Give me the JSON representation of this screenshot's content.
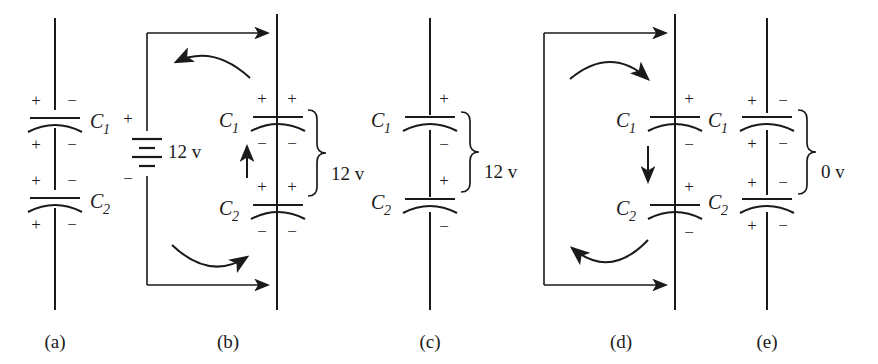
{
  "figure": {
    "background_color": "#ffffff",
    "line_color": "#1a1a1a",
    "panel_labels": [
      "(a)",
      "(b)",
      "(c)",
      "(d)",
      "(e)"
    ],
    "capacitor_names": {
      "c1": "C",
      "c1_sub": "1",
      "c2": "C",
      "c2_sub": "2"
    },
    "signs": {
      "plus": "+",
      "minus": "−"
    },
    "panels": [
      {
        "id": "a",
        "label": "(a)",
        "has_source": false,
        "has_loop": false,
        "has_brace": false,
        "brace_value": "",
        "cap_label_side": "right",
        "capacitors": [
          {
            "name_base": "C",
            "name_sub": "1",
            "top_left_sign": "+",
            "top_right_sign": "−",
            "bottom_left_sign": "+",
            "bottom_right_sign": "−"
          },
          {
            "name_base": "C",
            "name_sub": "2",
            "top_left_sign": "+",
            "top_right_sign": "−",
            "bottom_left_sign": "+",
            "bottom_right_sign": "−"
          }
        ]
      },
      {
        "id": "b",
        "label": "(b)",
        "has_source": true,
        "source_value": "12 v",
        "source_plus": "+",
        "source_minus": "−",
        "has_loop": true,
        "loop_arrow_direction": "clockwise",
        "inner_arrow_direction": "up",
        "has_brace": true,
        "brace_value": "12 v",
        "cap_label_side": "left",
        "capacitors": [
          {
            "name_base": "C",
            "name_sub": "1",
            "top_left_sign": "+",
            "top_right_sign": "+",
            "bottom_left_sign": "−",
            "bottom_right_sign": "−"
          },
          {
            "name_base": "C",
            "name_sub": "2",
            "top_left_sign": "+",
            "top_right_sign": "+",
            "bottom_left_sign": "−",
            "bottom_right_sign": "−"
          }
        ]
      },
      {
        "id": "c",
        "label": "(c)",
        "has_source": false,
        "has_loop": false,
        "has_brace": true,
        "brace_value": "12 v",
        "cap_label_side": "left",
        "capacitors": [
          {
            "name_base": "C",
            "name_sub": "1",
            "top_right_sign": "+",
            "bottom_right_sign": "−"
          },
          {
            "name_base": "C",
            "name_sub": "2",
            "top_right_sign": "+",
            "bottom_right_sign": "−"
          }
        ]
      },
      {
        "id": "d",
        "label": "(d)",
        "has_source": false,
        "has_loop": true,
        "loop_arrow_direction": "clockwise",
        "inner_arrow_direction": "down",
        "has_brace": false,
        "brace_value": "",
        "cap_label_side": "left",
        "capacitors": [
          {
            "name_base": "C",
            "name_sub": "1",
            "top_right_sign": "+",
            "bottom_right_sign": "−"
          },
          {
            "name_base": "C",
            "name_sub": "2",
            "top_right_sign": "+",
            "bottom_right_sign": "−"
          }
        ]
      },
      {
        "id": "e",
        "label": "(e)",
        "has_source": false,
        "has_loop": false,
        "has_brace": true,
        "brace_value": "0 v",
        "cap_label_side": "left",
        "capacitors": [
          {
            "name_base": "C",
            "name_sub": "1",
            "top_left_sign": "+",
            "top_right_sign": "−",
            "bottom_left_sign": "+",
            "bottom_right_sign": "−"
          },
          {
            "name_base": "C",
            "name_sub": "2",
            "top_left_sign": "+",
            "top_right_sign": "−",
            "bottom_left_sign": "+",
            "bottom_right_sign": "−"
          }
        ]
      }
    ],
    "voltage_labels": [
      "12 v",
      "12 v",
      "12 v",
      "0 v"
    ]
  }
}
